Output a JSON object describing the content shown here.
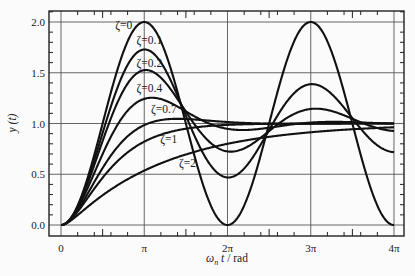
{
  "chart_data": {
    "type": "line",
    "title": "",
    "xlabel": "ω_n t / rad",
    "xlabel_parts": {
      "omega": "ω",
      "sub": "n",
      "t": " t",
      "unit": " / rad"
    },
    "ylabel": "y (t)",
    "xlim": [
      -0.45,
      12.95
    ],
    "ylim": [
      -0.07,
      2.14
    ],
    "x_ticks": [
      {
        "value": 0,
        "label": "0"
      },
      {
        "value": 3.14159,
        "label": "π"
      },
      {
        "value": 6.28318,
        "label": "2π"
      },
      {
        "value": 9.42478,
        "label": "3π"
      },
      {
        "value": 12.56637,
        "label": "4π"
      }
    ],
    "y_ticks": [
      {
        "value": 0.0,
        "label": "0.0"
      },
      {
        "value": 0.5,
        "label": "0.5"
      },
      {
        "value": 1.0,
        "label": "1.0"
      },
      {
        "value": 1.5,
        "label": "1.5"
      },
      {
        "value": 2.0,
        "label": "2.0"
      }
    ],
    "grid": true,
    "legend": "inline labels",
    "series": [
      {
        "name": "ζ=0",
        "zeta": 0,
        "label_x": 2.05,
        "label_y": 1.93,
        "peak": 2.0,
        "note": "y = 1 - cos(ω_n t)"
      },
      {
        "name": "ζ=0.1",
        "zeta": 0.1,
        "label_x": 2.85,
        "label_y": 1.78,
        "peak": 1.73
      },
      {
        "name": "ζ=0.2",
        "zeta": 0.2,
        "label_x": 2.85,
        "label_y": 1.56,
        "peak": 1.53
      },
      {
        "name": "ζ=0.4",
        "zeta": 0.4,
        "label_x": 2.85,
        "label_y": 1.31,
        "peak": 1.25
      },
      {
        "name": "ζ=0.7",
        "zeta": 0.7,
        "label_x": 3.4,
        "label_y": 1.1,
        "peak": 1.05
      },
      {
        "name": "ζ=1",
        "zeta": 1,
        "label_x": 3.75,
        "label_y": 0.81
      },
      {
        "name": "ζ=2",
        "zeta": 2,
        "label_x": 4.45,
        "label_y": 0.57
      }
    ],
    "sample_points": {
      "x": [
        0,
        3.14159,
        6.28318,
        9.42478,
        12.56637
      ],
      "zeta_0": [
        0.0,
        2.0,
        0.0,
        2.0,
        0.0
      ],
      "zeta_0.1": [
        0.0,
        1.73,
        0.47,
        1.39,
        0.72
      ],
      "zeta_0.2": [
        0.0,
        1.53,
        0.72,
        1.14,
        0.93
      ],
      "zeta_0.4": [
        0.0,
        1.25,
        0.97,
        1.0,
        1.0
      ],
      "zeta_0.7": [
        0.0,
        1.04,
        1.0,
        1.0,
        1.0
      ],
      "zeta_1": [
        0.0,
        0.83,
        0.99,
        1.0,
        1.0
      ],
      "zeta_2": [
        0.0,
        0.57,
        0.83,
        0.93,
        0.97
      ]
    }
  }
}
